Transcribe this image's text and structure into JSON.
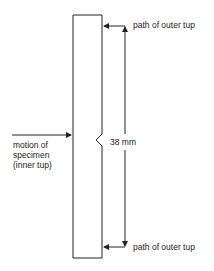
{
  "diagram": {
    "labels": {
      "top_path": "path of outer tup",
      "bottom_path": "path of outer tup",
      "dimension": "38 mm",
      "motion_line1": "motion of",
      "motion_line2": "specimen",
      "motion_line3": "(inner tup)"
    },
    "colors": {
      "stroke": "#222222",
      "background": "#ffffff"
    }
  }
}
